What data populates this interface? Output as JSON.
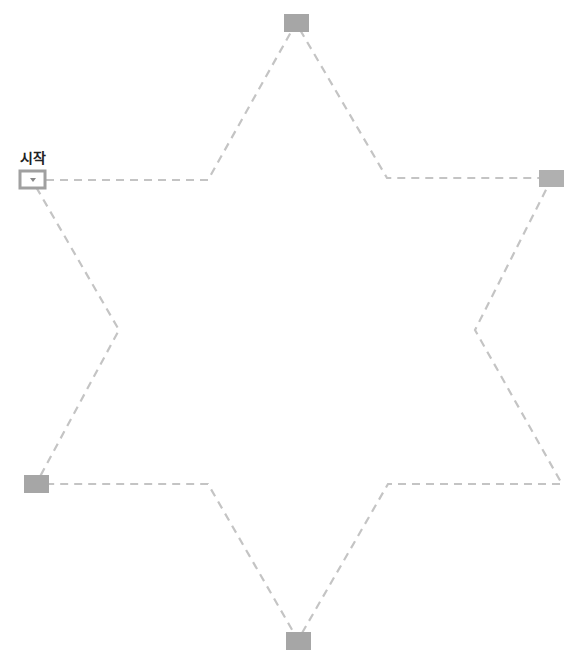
{
  "start_label": "시작",
  "colors": {
    "line": "#bdbdbd",
    "node": "#a6a6a6",
    "start_border": "#9e9e9e"
  },
  "path": {
    "points": [
      [
        32,
        180
      ],
      [
        208,
        180
      ],
      [
        296,
        23
      ],
      [
        387,
        178
      ],
      [
        552,
        178
      ],
      [
        475,
        330
      ],
      [
        562,
        484
      ],
      [
        388,
        484
      ],
      [
        298,
        640
      ],
      [
        208,
        484
      ],
      [
        36,
        484
      ],
      [
        119,
        330
      ],
      [
        32,
        180
      ]
    ]
  },
  "nodes": [
    {
      "name": "start-node",
      "x": 32,
      "y": 180,
      "start": true
    },
    {
      "name": "node-top",
      "x": 296,
      "y": 23
    },
    {
      "name": "node-right",
      "x": 551,
      "y": 178
    },
    {
      "name": "node-bottom-right",
      "x": 562,
      "y": 484
    },
    {
      "name": "node-bottom",
      "x": 298,
      "y": 640
    },
    {
      "name": "node-left",
      "x": 36,
      "y": 484
    }
  ]
}
